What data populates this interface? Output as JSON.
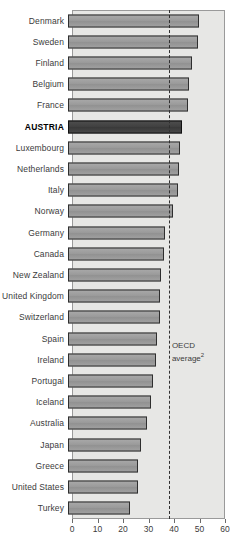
{
  "title_fragment": "",
  "chart_data": {
    "type": "bar",
    "orientation": "horizontal",
    "title": "",
    "subtitle": "",
    "xlabel": "",
    "ylabel": "",
    "xlim": [
      0,
      60
    ],
    "xticks": [
      0,
      10,
      20,
      30,
      40,
      50,
      60
    ],
    "xtick_labels": [
      "0",
      "10",
      "20",
      "30",
      "40",
      "50",
      "60"
    ],
    "grid": false,
    "legend": null,
    "highlight_category": "AUSTRIA",
    "categories": [
      "Denmark",
      "Sweden",
      "Finland",
      "Belgium",
      "France",
      "AUSTRIA",
      "Luxembourg",
      "Netherlands",
      "Italy",
      "Norway",
      "Germany",
      "Canada",
      "New Zealand",
      "United Kingdom",
      "Switzerland",
      "Spain",
      "Ireland",
      "Portugal",
      "Iceland",
      "Australia",
      "Japan",
      "Greece",
      "United States",
      "Turkey"
    ],
    "values": [
      51.5,
      51.0,
      48.5,
      47.5,
      47.0,
      44.6,
      44.0,
      43.5,
      43.0,
      41.0,
      38.0,
      37.5,
      36.5,
      36.0,
      36.0,
      35.0,
      34.5,
      33.5,
      32.5,
      31.0,
      28.5,
      27.5,
      27.5,
      24.5
    ],
    "annotations": [
      {
        "name": "oecd-average-line",
        "type": "vline",
        "value": 38.0,
        "style": "dashed",
        "label_line1": "OECD",
        "label_line2": "average",
        "label_superscript": "2"
      }
    ],
    "colors": {
      "bar_fill": "#9d9d9d",
      "bar_edge": "#2e2e2e",
      "highlight_fill": "#454545",
      "plot_background": "#e7e7e5",
      "axis_line": "#6b6b6b",
      "text": "#3b3b3b"
    }
  }
}
